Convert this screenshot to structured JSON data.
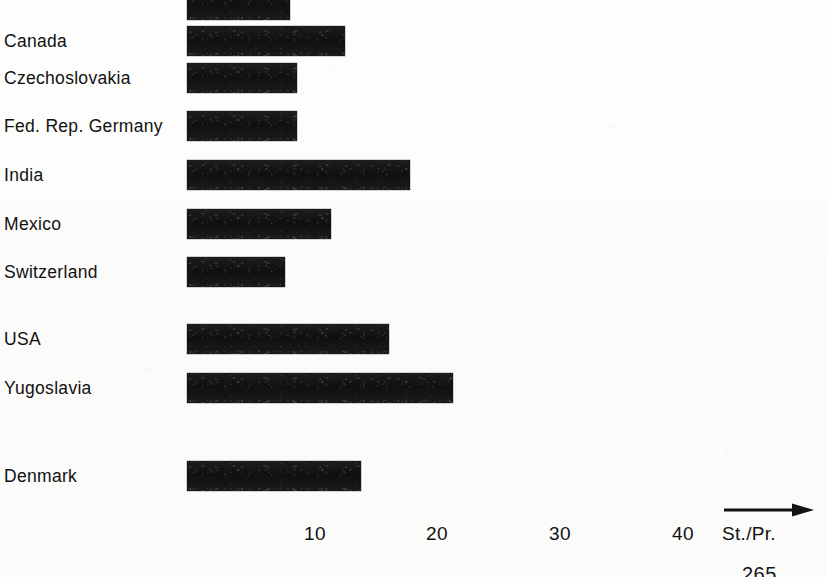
{
  "figure": {
    "page_number": "265",
    "axis_unit_label": "St./Pr.",
    "axis_arrow_icon": "right-arrow-icon"
  },
  "chart_data": {
    "type": "bar",
    "orientation": "horizontal",
    "title": "",
    "xlabel": "St./Pr.",
    "ylabel": "",
    "categories": [
      "",
      "Canada",
      "Czechoslovakia",
      "Fed. Rep. Germany",
      "India",
      "Mexico",
      "Switzerland",
      "USA",
      "Yugoslavia",
      "Denmark"
    ],
    "values": [
      8.4,
      12.8,
      9.0,
      9.0,
      18.3,
      11.7,
      8.0,
      16.4,
      21.6,
      14.1
    ],
    "xlim": [
      0,
      45
    ],
    "xticks": [
      10,
      20,
      30,
      40
    ],
    "xticklabels": [
      "10",
      "20",
      "30",
      "40"
    ],
    "grid": false,
    "legend": null
  },
  "bars": [
    {
      "label": "",
      "value": 8.4,
      "top": -14,
      "width_px": 103,
      "label_visible": false
    },
    {
      "label": "Canada",
      "value": 12.8,
      "top": 22,
      "width_px": 158,
      "label_visible": true
    },
    {
      "label": "Czechoslovakia",
      "value": 9.0,
      "top": 59,
      "width_px": 110,
      "label_visible": true
    },
    {
      "label": "Fed. Rep. Germany",
      "value": 9.0,
      "top": 107,
      "width_px": 110,
      "label_visible": true
    },
    {
      "label": "India",
      "value": 18.3,
      "top": 156,
      "width_px": 223,
      "label_visible": true
    },
    {
      "label": "Mexico",
      "value": 11.7,
      "top": 205,
      "width_px": 144,
      "label_visible": true
    },
    {
      "label": "Switzerland",
      "value": 8.0,
      "top": 253,
      "width_px": 98,
      "label_visible": true
    },
    {
      "label": "USA",
      "value": 16.4,
      "top": 320,
      "width_px": 202,
      "label_visible": true
    },
    {
      "label": "Yugoslavia",
      "value": 21.6,
      "top": 369,
      "width_px": 266,
      "label_visible": true
    },
    {
      "label": "Denmark",
      "value": 14.1,
      "top": 457,
      "width_px": 174,
      "label_visible": true
    }
  ],
  "ticks": [
    {
      "text": "10",
      "x": 315
    },
    {
      "text": "20",
      "x": 437
    },
    {
      "text": "30",
      "x": 560
    },
    {
      "text": "40",
      "x": 683
    }
  ],
  "colors": {
    "bar": "#181818",
    "text": "#121212",
    "paper": "#fdfdfc"
  }
}
